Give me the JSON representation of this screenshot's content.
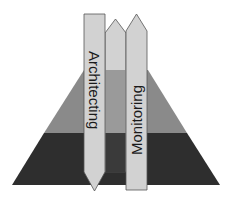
{
  "diagram": {
    "type": "pyramid-with-arrows",
    "pyramid": {
      "layers": [
        {
          "name": "top",
          "color": "#c9c9c9"
        },
        {
          "name": "middle",
          "color": "#8a8a8a"
        },
        {
          "name": "bottom",
          "color": "#2e2e2e"
        }
      ]
    },
    "arrows": [
      {
        "label": "Architecting",
        "direction": "down",
        "color": "#d2d2d2"
      },
      {
        "label": "",
        "direction": "up",
        "color": "#d2d2d2"
      },
      {
        "label": "Monitoring",
        "direction": "up",
        "color": "#d2d2d2"
      }
    ]
  }
}
